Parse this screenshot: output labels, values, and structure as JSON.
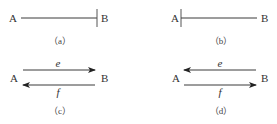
{
  "colors": {
    "stroke": "#3a3a3a",
    "text": "#333333",
    "background": "#ffffff"
  },
  "panels": [
    {
      "id": "a",
      "caption": "（a）",
      "left_label": "A",
      "right_label": "B",
      "description": "Segment AB with a vertical bar (fixed end) at B"
    },
    {
      "id": "b",
      "caption": "（b）",
      "left_label": "A",
      "right_label": "B",
      "description": "Segment AB with a vertical bar (fixed end) at A"
    },
    {
      "id": "c",
      "caption": "（c）",
      "left_label": "A",
      "right_label": "B",
      "top_arrow": {
        "label": "e",
        "direction": "A-to-B"
      },
      "bottom_arrow": {
        "label": "f",
        "direction": "B-to-A"
      }
    },
    {
      "id": "d",
      "caption": "（d）",
      "left_label": "A",
      "right_label": "B",
      "top_arrow": {
        "label": "e",
        "direction": "B-to-A"
      },
      "bottom_arrow": {
        "label": "f",
        "direction": "A-to-B"
      }
    }
  ]
}
